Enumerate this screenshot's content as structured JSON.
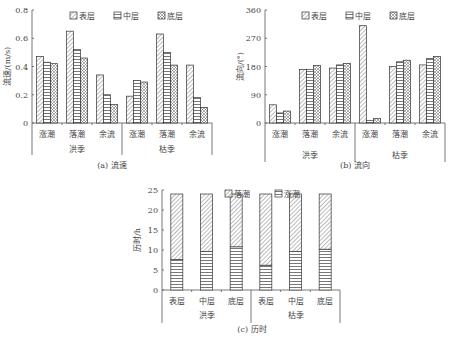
{
  "chart_data": [
    {
      "id": "a",
      "type": "bar",
      "caption": "(a) 流速",
      "ylabel": "流速/(m/s)",
      "ylim": [
        0,
        0.8
      ],
      "yticks": [
        0,
        0.2,
        0.4,
        0.6,
        0.8
      ],
      "ytick_labels": [
        "0",
        "0.2",
        "0.4",
        "0.6",
        "0.8"
      ],
      "categories": [
        "涨潮",
        "落潮",
        "余流",
        "涨潮",
        "落潮",
        "余流"
      ],
      "groups": [
        {
          "label": "洪季",
          "span": [
            0,
            2
          ]
        },
        {
          "label": "枯季",
          "span": [
            3,
            5
          ]
        }
      ],
      "legend": [
        "表层",
        "中层",
        "底层"
      ],
      "legend_position": "top",
      "series": [
        {
          "name": "表层",
          "pattern": "diag",
          "values": [
            0.47,
            0.65,
            0.34,
            0.19,
            0.63,
            0.41
          ]
        },
        {
          "name": "中层",
          "pattern": "hline",
          "values": [
            0.43,
            0.52,
            0.2,
            0.3,
            0.5,
            0.18
          ]
        },
        {
          "name": "底层",
          "pattern": "cross",
          "values": [
            0.42,
            0.46,
            0.13,
            0.29,
            0.41,
            0.11
          ]
        }
      ]
    },
    {
      "id": "b",
      "type": "bar",
      "caption": "(b) 流向",
      "ylabel": "流向/(°)",
      "ylim": [
        0,
        360
      ],
      "yticks": [
        0,
        90,
        180,
        270,
        360
      ],
      "ytick_labels": [
        "0",
        "90",
        "180",
        "270",
        "360"
      ],
      "categories": [
        "涨潮",
        "落潮",
        "余流",
        "涨潮",
        "落潮",
        "余流"
      ],
      "groups": [
        {
          "label": "洪季",
          "span": [
            0,
            2
          ]
        },
        {
          "label": "枯季",
          "span": [
            3,
            5
          ]
        }
      ],
      "legend": [
        "表层",
        "中层",
        "底层"
      ],
      "legend_position": "top",
      "series": [
        {
          "name": "表层",
          "pattern": "diag",
          "values": [
            58,
            170,
            175,
            310,
            180,
            185
          ]
        },
        {
          "name": "中层",
          "pattern": "hline",
          "values": [
            32,
            170,
            185,
            8,
            195,
            205
          ]
        },
        {
          "name": "底层",
          "pattern": "cross",
          "values": [
            38,
            183,
            190,
            14,
            200,
            212
          ]
        }
      ]
    },
    {
      "id": "c",
      "type": "bar",
      "stacked": true,
      "caption": "(c) 历时",
      "ylabel": "历时/h",
      "ylim": [
        0,
        25
      ],
      "yticks": [
        0,
        5,
        10,
        15,
        20,
        25
      ],
      "ytick_labels": [
        "0",
        "5",
        "10",
        "15",
        "20",
        "25"
      ],
      "categories": [
        "表层",
        "中层",
        "底层",
        "表层",
        "中层",
        "底层"
      ],
      "groups": [
        {
          "label": "洪季",
          "span": [
            0,
            2
          ]
        },
        {
          "label": "枯季",
          "span": [
            3,
            5
          ]
        }
      ],
      "legend": [
        "落潮",
        "涨潮"
      ],
      "legend_position": "top",
      "series": [
        {
          "name": "涨潮",
          "pattern": "hline",
          "values": [
            7.6,
            9.6,
            10.8,
            6.2,
            9.6,
            10.2
          ]
        },
        {
          "name": "落潮",
          "pattern": "diag",
          "values": [
            16.4,
            14.4,
            13.2,
            17.8,
            14.4,
            13.8
          ]
        }
      ]
    }
  ]
}
